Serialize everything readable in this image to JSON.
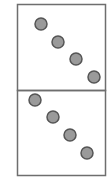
{
  "diagram": {
    "panels": [
      {
        "name": "top-panel",
        "x": 17,
        "y": 4,
        "width": 88,
        "height": 86,
        "dots": [
          {
            "cx": 41,
            "cy": 24
          },
          {
            "cx": 58,
            "cy": 42
          },
          {
            "cx": 76,
            "cy": 59
          },
          {
            "cx": 94,
            "cy": 77
          }
        ]
      },
      {
        "name": "bottom-panel",
        "x": 17,
        "y": 90,
        "width": 88,
        "height": 85,
        "dots": [
          {
            "cx": 35,
            "cy": 100
          },
          {
            "cx": 53,
            "cy": 117
          },
          {
            "cx": 70,
            "cy": 135
          },
          {
            "cx": 87,
            "cy": 153
          }
        ]
      }
    ],
    "colors": {
      "border": "#6e6e6e",
      "dot_fill": "#9a9a9a",
      "dot_stroke": "#555555",
      "background": "#ffffff"
    },
    "dot_radius": 6
  }
}
